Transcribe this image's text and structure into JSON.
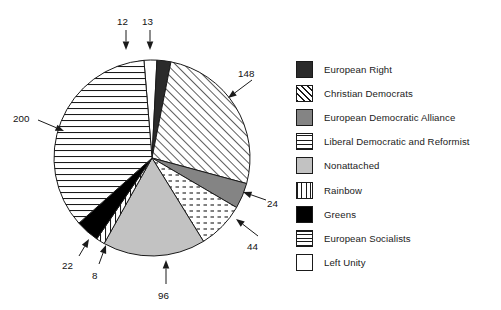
{
  "chart_data": {
    "type": "pie",
    "title": "",
    "subtitle": "",
    "xlabel": "",
    "ylabel": "",
    "total": 567,
    "legend_position": "right",
    "grid": false,
    "categories": [
      "European Right",
      "Christian Democrats",
      "European Democratic Alliance",
      "Liberal Democratic and Reformist",
      "Nonattached",
      "Rainbow",
      "Greens",
      "European Socialists",
      "Left Unity"
    ],
    "values": [
      13,
      148,
      24,
      44,
      96,
      8,
      22,
      200,
      12
    ],
    "slices": [
      {
        "label": "Left Unity",
        "value": 12,
        "pattern": "solid-white",
        "fill": "#ffffff",
        "data_label": "12"
      },
      {
        "label": "European Right",
        "value": 13,
        "pattern": "solid-dark",
        "fill": "#2b2b2b",
        "data_label": "13"
      },
      {
        "label": "Christian Democrats",
        "value": 148,
        "pattern": "diagonal-hatch",
        "fill": "#ffffff",
        "data_label": "148"
      },
      {
        "label": "European Democratic Alliance",
        "value": 24,
        "pattern": "solid-gray",
        "fill": "#848484",
        "data_label": "24"
      },
      {
        "label": "Liberal Democratic and Reformist",
        "value": 44,
        "pattern": "dotted-dash",
        "fill": "#ffffff",
        "data_label": "44"
      },
      {
        "label": "Nonattached",
        "value": 96,
        "pattern": "solid-lightgray",
        "fill": "#c2c2c2",
        "data_label": "96"
      },
      {
        "label": "Rainbow",
        "value": 8,
        "pattern": "vertical-lines",
        "fill": "#ffffff",
        "data_label": "8"
      },
      {
        "label": "Greens",
        "value": 22,
        "pattern": "solid-black",
        "fill": "#000000",
        "data_label": "22"
      },
      {
        "label": "European Socialists",
        "value": 200,
        "pattern": "horizontal-lines",
        "fill": "#ffffff",
        "data_label": "200"
      }
    ],
    "annotations": [
      {
        "text": "12",
        "x": 117,
        "y": 16
      },
      {
        "text": "13",
        "x": 142,
        "y": 16
      },
      {
        "text": "148",
        "x": 238,
        "y": 68
      },
      {
        "text": "200",
        "x": 13,
        "y": 113
      },
      {
        "text": "24",
        "x": 267,
        "y": 198
      },
      {
        "text": "44",
        "x": 247,
        "y": 241
      },
      {
        "text": "22",
        "x": 62,
        "y": 260
      },
      {
        "text": "8",
        "x": 92,
        "y": 270
      },
      {
        "text": "96",
        "x": 158,
        "y": 290
      }
    ]
  },
  "legend": {
    "items": [
      {
        "label": "European Right",
        "pattern": "solid-dark"
      },
      {
        "label": "Christian Democrats",
        "pattern": "diagonal-hatch"
      },
      {
        "label": "European Democratic Alliance",
        "pattern": "solid-gray"
      },
      {
        "label": "Liberal Democratic and Reformist",
        "pattern": "dotted-dash"
      },
      {
        "label": "Nonattached",
        "pattern": "solid-lightgray"
      },
      {
        "label": "Rainbow",
        "pattern": "vertical-lines"
      },
      {
        "label": "Greens",
        "pattern": "solid-black"
      },
      {
        "label": "European Socialists",
        "pattern": "horizontal-lines"
      },
      {
        "label": "Left Unity",
        "pattern": "solid-white"
      }
    ]
  },
  "colors": {
    "stroke": "#1a1a1a",
    "background": "#ffffff",
    "dark": "#2b2b2b",
    "gray": "#848484",
    "light_gray": "#c2c2c2",
    "black": "#000000",
    "white": "#ffffff"
  }
}
